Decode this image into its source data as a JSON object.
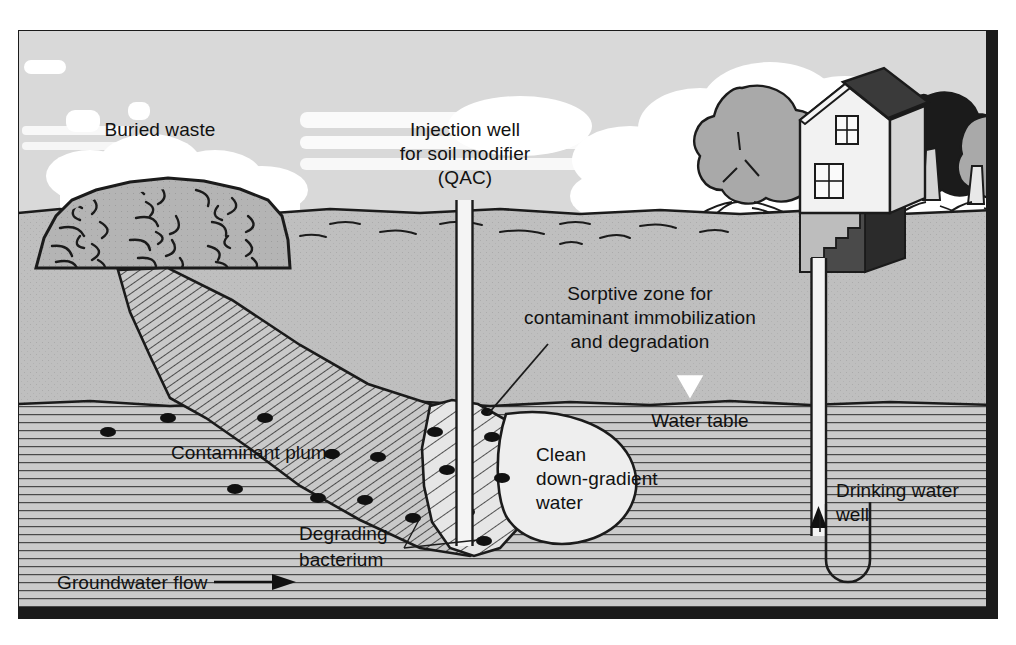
{
  "figure": {
    "frame": {
      "border_color": "#1b1b1b",
      "sky_color": "#d8d8d8",
      "cloud_color": "#ffffff",
      "soil_color": "#bdbdbd",
      "aquifer_color": "#cacaca",
      "plume_fill": "#c6c6c6",
      "sorptive_fill": "#e2e2e2",
      "clean_water_fill": "#ededed",
      "ink_color": "#1b1b1b"
    }
  },
  "labels": {
    "buried_waste": "Buried waste",
    "injection_well_line1": "Injection well",
    "injection_well_line2": "for soil modifier",
    "injection_well_line3": "(QAC)",
    "sorptive_zone_line1": "Sorptive zone for",
    "sorptive_zone_line2": "contaminant immobilization",
    "sorptive_zone_line3": "and degradation",
    "water_table": "Water table",
    "clean_water_line1": "Clean",
    "clean_water_line2": "down-gradient",
    "clean_water_line3": "water",
    "contaminant_plume": "Contaminant plume",
    "degrading_bacterium_line1": "Degrading",
    "degrading_bacterium_line2": "bacterium",
    "groundwater_flow": "Groundwater flow",
    "drinking_water_well_line1": "Drinking water",
    "drinking_water_well_line2": "well"
  },
  "scene": {
    "ground_level_y": 213,
    "water_table_y": 404,
    "bacteria_count": 16,
    "bacteria_points": [
      {
        "x": 108,
        "y": 432
      },
      {
        "x": 168,
        "y": 418
      },
      {
        "x": 265,
        "y": 418
      },
      {
        "x": 235,
        "y": 489
      },
      {
        "x": 332,
        "y": 454
      },
      {
        "x": 378,
        "y": 457
      },
      {
        "x": 318,
        "y": 498
      },
      {
        "x": 365,
        "y": 500
      },
      {
        "x": 413,
        "y": 518
      },
      {
        "x": 435,
        "y": 432
      },
      {
        "x": 447,
        "y": 470
      },
      {
        "x": 467,
        "y": 512
      },
      {
        "x": 487,
        "y": 412
      },
      {
        "x": 488,
        "y": 436
      },
      {
        "x": 500,
        "y": 478
      },
      {
        "x": 484,
        "y": 541
      }
    ],
    "trees": [
      {
        "name": "left-tree",
        "x": 742,
        "y": 150,
        "tone": "gray"
      },
      {
        "name": "right-tree-dark",
        "x": 930,
        "y": 150,
        "tone": "dark"
      },
      {
        "name": "right-tree-gray",
        "x": 975,
        "y": 170,
        "tone": "gray"
      }
    ],
    "house": {
      "x": 800,
      "y": 120,
      "roof_tone": "dark",
      "wall_tone": "light",
      "windows": 2
    },
    "groundwater_flow_direction": "left-to-right"
  }
}
